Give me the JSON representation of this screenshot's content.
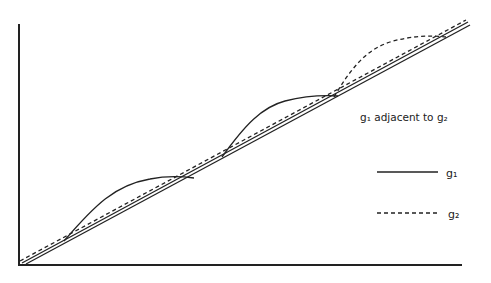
{
  "diagram": {
    "annotation": "g₁ adjacent to g₂",
    "legend": [
      {
        "label": "g₁",
        "style": "solid"
      },
      {
        "label": "g₂",
        "style": "dashed"
      }
    ],
    "colors": {
      "ink": "#222222",
      "background": "#ffffff"
    },
    "axes": {
      "origin": [
        19,
        265
      ],
      "x_end": [
        462,
        265
      ],
      "y_end": [
        19,
        24
      ]
    }
  }
}
